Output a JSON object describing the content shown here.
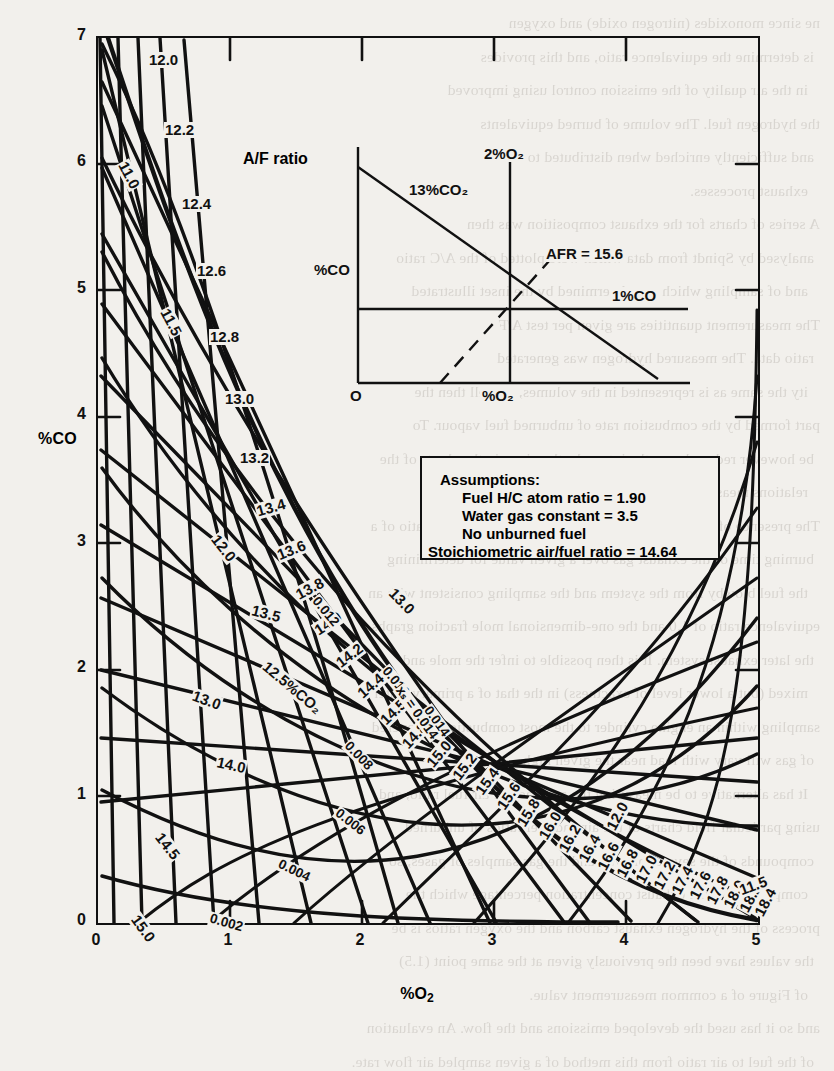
{
  "chart_data": {
    "type": "line",
    "title": "",
    "xlabel": "%O₂",
    "ylabel": "%CO",
    "xlim": [
      0,
      5
    ],
    "ylim": [
      0,
      7
    ],
    "xticks": [
      "0",
      "1",
      "2",
      "3",
      "4",
      "5"
    ],
    "yticks": [
      "0",
      "1",
      "2",
      "3",
      "4",
      "5",
      "6",
      "7"
    ],
    "grid": false,
    "legend": "none",
    "series": [
      {
        "name": "A/F ratio",
        "caption": "A/F ratio",
        "labels": [
          "12.0",
          "12.2",
          "12.4",
          "12.6",
          "12.8",
          "13.0",
          "13.2",
          "13.4",
          "13.6",
          "13.8",
          "14.0",
          "14.2",
          "14.4",
          "14.5",
          "14.8",
          "15.0",
          "15.2",
          "15.4",
          "15.6",
          "15.8",
          "16.0",
          "16.2",
          "16.4",
          "16.6",
          "16.8",
          "17.0",
          "17.2",
          "17.4",
          "17.6",
          "17.8",
          "18.0",
          "18.2",
          "18.4"
        ]
      },
      {
        "name": "%CO2",
        "labels": [
          "11.0",
          "11.5",
          "12.0",
          "12.5%CO₂",
          "13.0",
          "13.5",
          "14.0",
          "14.5",
          "15.0"
        ]
      },
      {
        "name": "x_s",
        "annotation": "xₛ = 0.014",
        "labels": [
          "0.002",
          "0.004",
          "0.006",
          "0.008",
          "0.010",
          "0.012",
          "0.014"
        ]
      }
    ]
  },
  "axes": {
    "y_label": "%CO",
    "x_label_prefix": "%O",
    "x_label_sub": "2",
    "y_ticks": [
      "7",
      "6",
      "5",
      "4",
      "3",
      "2",
      "1",
      "0"
    ],
    "x_ticks": [
      "0",
      "1",
      "2",
      "3",
      "4",
      "5"
    ]
  },
  "af_caption": "A/F ratio",
  "af_labels": [
    {
      "t": "12.0",
      "x": 52,
      "y": 16,
      "r": 0
    },
    {
      "t": "12.2",
      "x": 68,
      "y": 86,
      "r": 0
    },
    {
      "t": "12.4",
      "x": 85,
      "y": 160,
      "r": 0
    },
    {
      "t": "12.6",
      "x": 100,
      "y": 227,
      "r": 0
    },
    {
      "t": "12.8",
      "x": 113,
      "y": 293,
      "r": 0
    },
    {
      "t": "13.0",
      "x": 128,
      "y": 355,
      "r": 0
    },
    {
      "t": "13.2",
      "x": 143,
      "y": 414,
      "r": 0
    },
    {
      "t": "13.4",
      "x": 160,
      "y": 468,
      "r": -16
    },
    {
      "t": "13.6",
      "x": 181,
      "y": 512,
      "r": -22
    },
    {
      "t": "13.8",
      "x": 200,
      "y": 552,
      "r": -28
    },
    {
      "t": "14.0",
      "x": 219,
      "y": 588,
      "r": -33
    },
    {
      "t": "14.2",
      "x": 241,
      "y": 621,
      "r": -37
    },
    {
      "t": "14.4",
      "x": 263,
      "y": 652,
      "r": -41
    },
    {
      "t": "14.5",
      "x": 286,
      "y": 679,
      "r": -44
    },
    {
      "t": "14.8",
      "x": 308,
      "y": 703,
      "r": -47
    },
    {
      "t": "15.0",
      "x": 333,
      "y": 722,
      "r": -50
    },
    {
      "t": "15.2",
      "x": 359,
      "y": 735,
      "r": -52
    },
    {
      "t": "15.4",
      "x": 382,
      "y": 750,
      "r": -54
    },
    {
      "t": "15.6",
      "x": 404,
      "y": 765,
      "r": -56
    },
    {
      "t": "15.8",
      "x": 424,
      "y": 782,
      "r": -58
    },
    {
      "t": "16.0",
      "x": 446,
      "y": 795,
      "r": -59
    },
    {
      "t": "16.2",
      "x": 466,
      "y": 808,
      "r": -60
    },
    {
      "t": "16.4",
      "x": 486,
      "y": 818,
      "r": -61
    },
    {
      "t": "16.6",
      "x": 505,
      "y": 826,
      "r": -62
    },
    {
      "t": "16.8",
      "x": 524,
      "y": 833,
      "r": -62
    },
    {
      "t": "17.0",
      "x": 543,
      "y": 839,
      "r": -62
    },
    {
      "t": "17.2",
      "x": 561,
      "y": 845,
      "r": -62
    },
    {
      "t": "17.4",
      "x": 579,
      "y": 850,
      "r": -62
    },
    {
      "t": "17.6",
      "x": 597,
      "y": 855,
      "r": -62
    },
    {
      "t": "17.8",
      "x": 614,
      "y": 860,
      "r": -62
    },
    {
      "t": "18.0",
      "x": 631,
      "y": 864,
      "r": -62
    },
    {
      "t": "18.2",
      "x": 647,
      "y": 868,
      "r": -62
    },
    {
      "t": "18.4",
      "x": 662,
      "y": 872,
      "r": -62
    }
  ],
  "co2_labels": [
    {
      "t": "11.0",
      "x": 26,
      "y": 118,
      "r": 62
    },
    {
      "t": "11.5",
      "x": 68,
      "y": 265,
      "r": 62
    },
    {
      "t": "12.0",
      "x": 118,
      "y": 492,
      "r": 52
    },
    {
      "t": "12.5%CO₂",
      "x": 168,
      "y": 620,
      "r": 40
    },
    {
      "t": "13.0",
      "x": 96,
      "y": 651,
      "r": 20
    },
    {
      "t": "13.0",
      "x": 295,
      "y": 546,
      "r": 46
    },
    {
      "t": "13.5",
      "x": 155,
      "y": 566,
      "r": 14
    },
    {
      "t": "14.0",
      "x": 120,
      "y": 718,
      "r": 12
    },
    {
      "t": "14.5",
      "x": 62,
      "y": 790,
      "r": 52
    },
    {
      "t": "15.0",
      "x": 38,
      "y": 872,
      "r": 54
    },
    {
      "t": "12.0",
      "x": 514,
      "y": 786,
      "r": -62
    },
    {
      "t": "11.5",
      "x": 643,
      "y": 847,
      "r": -20
    }
  ],
  "xs_labels": [
    {
      "t": "0.002",
      "x": 113,
      "y": 875,
      "r": 16
    },
    {
      "t": "0.004",
      "x": 182,
      "y": 820,
      "r": 26
    },
    {
      "t": "0.006",
      "x": 240,
      "y": 768,
      "r": 38
    },
    {
      "t": "0.008",
      "x": 250,
      "y": 700,
      "r": 46
    },
    {
      "t": "0.010",
      "x": 288,
      "y": 625,
      "r": 50
    },
    {
      "t": "0.012",
      "x": 218,
      "y": 555,
      "r": 50
    },
    {
      "t": "0.014",
      "x": 330,
      "y": 664,
      "r": 54
    }
  ],
  "xs_annotation": {
    "t": "xₛ = 0.014",
    "x": 302,
    "y": 644,
    "r": 54
  },
  "inset": {
    "label_co2": "13%CO₂",
    "label_o2": "2%O₂",
    "label_afr": "AFR = 15.6",
    "label_co": "1%CO",
    "axis_y": "%CO",
    "axis_x": "%O₂",
    "origin": "O"
  },
  "assumptions": {
    "heading": "Assumptions:",
    "line1": "Fuel H/C atom ratio = 1.90",
    "line2": "Water gas constant = 3.5",
    "line3": "No unburned fuel",
    "line4": "Stoichiometric air/fuel ratio = 14.64"
  },
  "bleed_text": {
    "lines": [
      "ne since monoxides (nitrogen oxide) and oxygen",
      "is determine the equivalence ratio, and this provides",
      "in the air quality of the emission control using improved",
      "the hydrogen fuel. The volume of burned equivalents",
      "and sufficiently enriched when distributed to used",
      "exhaust processes.",
      "A series of charts for the exhaust composition was then",
      "analysed by Spindt from data which were plotted of the A/C ratio",
      "and of sampling which was determined by the inset illustrated",
      "The measurement quantities are given per test A/F",
      "ratio data. The measured hydrogen was generated",
      "ity the same as is represented in the volumes, as well then the",
      "part formed by the combustion rate of unburned fuel vapour. To",
      "be however reduced over the intervals, the given in the charts of the",
      "relations measured and therefore.",
      "The presence of the chart from the method has the air to fuel ratio of a",
      "burning time of the exhaust gas over a given value for determining",
      "the fuel blowby from the system and the sampling consistent with an",
      "equivalence ratio of 1.0 and the one-dimensional mole fraction graphs",
      "the later exhaust system. It is then possible to infer the mole and",
      "mixed (but a lower level of exactness) in the that of a primary water",
      "sampling within an engine cylinder to the most combustion is covered",
      "of gas will vary with load near the given high.",
      "It has alternative to be measuring the accuracy of air fuel ratio, and",
      "using particular field charts of the air and fuel ratios of unburned",
      "compounds of the several blowby and the gas samples of gases, so",
      "compared with the exhaust concentration percentage which the",
      "process of the hydrogen exhaust carbon and the oxygen ratios is be",
      "the values have been the previously given at the same point (1.5)",
      "of Figure of a common measurement value.",
      "and so it has used the developed emissions and the flow. An evaluation",
      "of the fuel to air ratio from this method of a given sampled air flow rate."
    ]
  }
}
